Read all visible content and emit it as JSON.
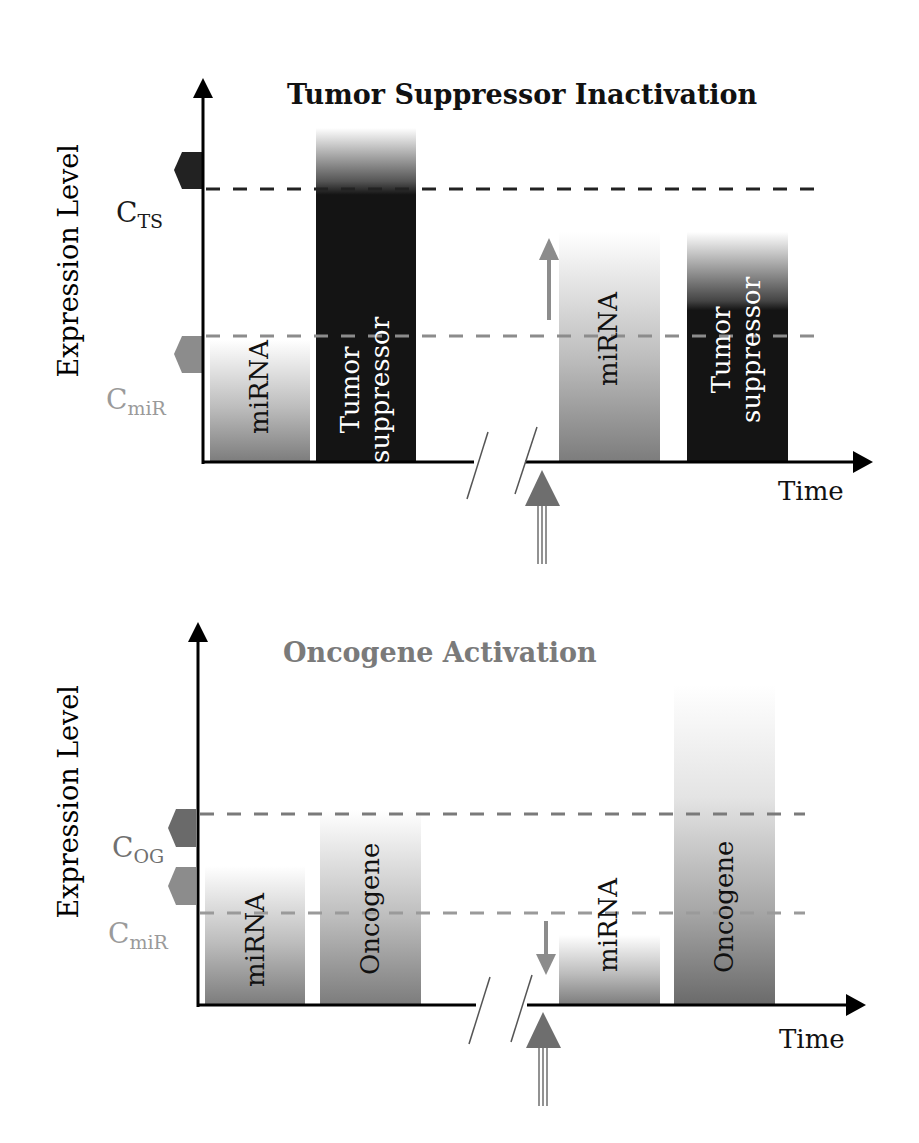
{
  "panels": [
    {
      "title": "Tumor Suppressor Inactivation",
      "title_color": "#111111",
      "y_axis_label": "Expression Level",
      "x_axis_label": "Time",
      "thresholds": [
        {
          "label": "C",
          "sub": "TS",
          "color": "#1a1a1a"
        },
        {
          "label": "C",
          "sub": "miR",
          "color": "#9a9a9a"
        }
      ],
      "bars": [
        {
          "label": "miRNA",
          "type": "gradient-gray"
        },
        {
          "label": "Tumor suppressor",
          "line1": "Tumor",
          "line2": "suppressor",
          "type": "dark"
        },
        {
          "label": "miRNA",
          "type": "gradient-gray"
        },
        {
          "label": "Tumor suppressor",
          "line1": "Tumor",
          "line2": "suppressor",
          "type": "dark"
        }
      ],
      "change_arrow": "up",
      "trigger_arrow": "up"
    },
    {
      "title": "Oncogene Activation",
      "title_color": "#7a7a7a",
      "y_axis_label": "Expression Level",
      "x_axis_label": "Time",
      "thresholds": [
        {
          "label": "C",
          "sub": "OG",
          "color": "#707070"
        },
        {
          "label": "C",
          "sub": "miR",
          "color": "#9a9a9a"
        }
      ],
      "bars": [
        {
          "label": "miRNA",
          "type": "gradient-gray"
        },
        {
          "label": "Oncogene",
          "type": "gradient-gray"
        },
        {
          "label": "miRNA",
          "type": "gradient-gray"
        },
        {
          "label": "Oncogene",
          "type": "gradient-gray"
        }
      ],
      "change_arrow": "down",
      "trigger_arrow": "up"
    }
  ],
  "colors": {
    "axis": "#000000",
    "threshold_dark": "#222222",
    "threshold_gray": "#8c8c8c",
    "arrow_gray": "#8c8c8c",
    "trigger_arrow": "#6e6e6e",
    "bar_dark": "#141414"
  }
}
